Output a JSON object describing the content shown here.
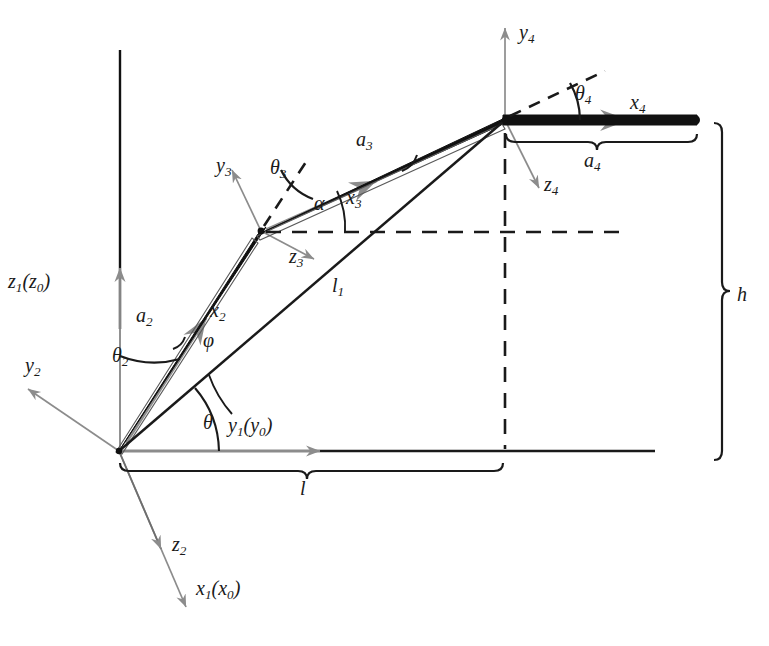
{
  "figure": {
    "kind": "kinematic-link-diagram",
    "colors": {
      "link": "#111111",
      "axis_gray": "#8c8c8c",
      "line_black": "#1a1a1a",
      "background": "#ffffff"
    }
  },
  "labels": {
    "z1z0": {
      "base": "z",
      "sub": "1",
      "paren_base": "z",
      "paren_sub": "0"
    },
    "y1y0": {
      "base": "y",
      "sub": "1",
      "paren_base": "y",
      "paren_sub": "0"
    },
    "x1x0": {
      "base": "x",
      "sub": "1",
      "paren_base": "x",
      "paren_sub": "0"
    },
    "y2": {
      "base": "y",
      "sub": "2"
    },
    "z2": {
      "base": "z",
      "sub": "2"
    },
    "x2": {
      "base": "x",
      "sub": "2"
    },
    "y3": {
      "base": "y",
      "sub": "3"
    },
    "z3": {
      "base": "z",
      "sub": "3"
    },
    "x3": {
      "base": "x",
      "sub": "3"
    },
    "y4": {
      "base": "y",
      "sub": "4"
    },
    "z4": {
      "base": "z",
      "sub": "4"
    },
    "x4": {
      "base": "x",
      "sub": "4"
    },
    "a2": {
      "base": "a",
      "sub": "2"
    },
    "a3": {
      "base": "a",
      "sub": "3"
    },
    "a4": {
      "base": "a",
      "sub": "4"
    },
    "l1": {
      "base": "l",
      "sub": "1"
    },
    "l": {
      "base": "l"
    },
    "h": {
      "base": "h"
    },
    "theta": {
      "base": "θ"
    },
    "theta2": {
      "base": "θ",
      "sub": "2"
    },
    "theta3": {
      "base": "θ",
      "sub": "3"
    },
    "theta4": {
      "base": "θ",
      "sub": "4"
    },
    "phi": {
      "base": "φ"
    },
    "alpha": {
      "base": "α"
    }
  },
  "geometry": {
    "origin": {
      "x": 119,
      "y": 451
    },
    "joint3": {
      "x": 261,
      "y": 231
    },
    "joint4": {
      "x": 505,
      "y": 120
    },
    "tip4": {
      "x": 697,
      "y": 120
    },
    "ground_line_y": 451,
    "ground_line_x_end": 655,
    "dashed_horizontal_y": 232,
    "dashed_vertical_x": 505,
    "brace_l_span": [
      119,
      503
    ],
    "brace_a4_span": [
      505,
      697
    ],
    "brace_h_span": [
      120,
      460
    ]
  }
}
